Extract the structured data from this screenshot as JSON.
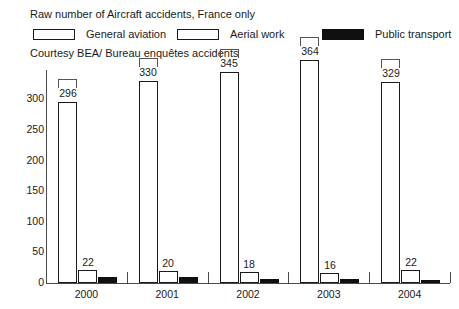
{
  "figure": {
    "title": "Raw number of Aircraft accidents, France only",
    "credit": "Courtesy BEA/ Bureau enquêtes accidents"
  },
  "legend": {
    "items": [
      {
        "label": "General aviation",
        "swatch": "white-outline",
        "color": "#ffffff"
      },
      {
        "label": "Aerial work",
        "swatch": "white-outline",
        "color": "#ffffff"
      },
      {
        "label": "Public transport",
        "swatch": "black-filled",
        "color": "#101010"
      }
    ]
  },
  "axes": {
    "y_ticks": [
      "0",
      "50",
      "100",
      "150",
      "200",
      "250",
      "300"
    ],
    "x_ticks": [
      "2000",
      "2001",
      "2002",
      "2003",
      "2004"
    ]
  },
  "chart_data": {
    "type": "bar",
    "title": "Raw number of Aircraft accidents, France only",
    "subtitle": "Courtesy BEA/ Bureau enquêtes accidents",
    "xlabel": "",
    "ylabel": "",
    "categories": [
      "2000",
      "2001",
      "2002",
      "2003",
      "2004"
    ],
    "series": [
      {
        "name": "General aviation",
        "values": [
          296,
          330,
          345,
          364,
          329
        ],
        "labels": [
          "296",
          "330",
          "345",
          "364",
          "329"
        ],
        "color": "#ffffff",
        "edgecolor": "#1a1a1a"
      },
      {
        "name": "Aerial work",
        "values": [
          22,
          20,
          18,
          16,
          22
        ],
        "labels": [
          "22",
          "20",
          "18",
          "16",
          "22"
        ],
        "color": "#ffffff",
        "edgecolor": "#1a1a1a"
      },
      {
        "name": "Public transport",
        "values": [
          9,
          9,
          6,
          6,
          5
        ],
        "labels": [
          "",
          "",
          "",
          "",
          ""
        ],
        "color": "#101010",
        "edgecolor": "#101010"
      }
    ],
    "ylim": [
      0,
      340
    ],
    "yticks": [
      0,
      50,
      100,
      150,
      200,
      250,
      300
    ],
    "grid": false,
    "legend_position": "top"
  }
}
